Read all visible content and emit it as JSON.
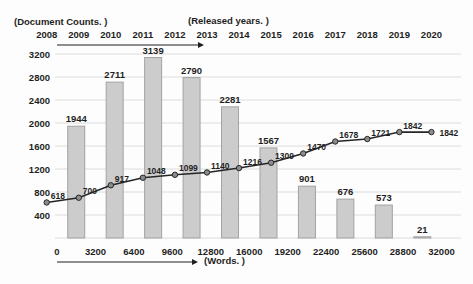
{
  "figure": {
    "y_axis_caption": "(Document Counts. )",
    "top_axis_caption": "(Released years. )",
    "x_axis_caption": "(Words. )"
  },
  "chart_data": {
    "type": "bar",
    "title": "",
    "grid": "horizontal",
    "legend": "none",
    "y_axis": {
      "caption": "(Document Counts. )",
      "ticks": [
        400,
        800,
        1200,
        1600,
        2000,
        2400,
        2800,
        3200
      ],
      "range": [
        0,
        3400
      ]
    },
    "x_bottom_axis": {
      "caption": "(Words. )",
      "ticks": [
        0,
        3200,
        6400,
        9600,
        12800,
        16000,
        19200,
        22400,
        25600,
        28800,
        32000
      ]
    },
    "x_top_axis": {
      "caption": "(Released years. )",
      "ticks": [
        2008,
        2009,
        2010,
        2011,
        2012,
        2013,
        2014,
        2015,
        2016,
        2017,
        2018,
        2019,
        2020
      ]
    },
    "series": [
      {
        "name": "document-counts-per-word-bin",
        "type": "bar",
        "bin_starts": [
          0,
          3200,
          6400,
          9600,
          12800,
          16000,
          19200,
          22400,
          25600,
          28800
        ],
        "bin_width": 3200,
        "values": [
          1944,
          2711,
          3139,
          2790,
          2281,
          1567,
          901,
          676,
          573,
          21
        ]
      },
      {
        "name": "documents-per-released-year",
        "type": "line",
        "categories": [
          2008,
          2009,
          2010,
          2011,
          2012,
          2013,
          2014,
          2015,
          2016,
          2017,
          2018,
          2019,
          2020
        ],
        "values": [
          618,
          700,
          917,
          1048,
          1099,
          1140,
          1216,
          1309,
          1470,
          1678,
          1721,
          1842,
          1842
        ]
      }
    ],
    "colors": {
      "bar_fill": "#cccccc",
      "bar_border": "#a3a3a3",
      "line": "#262626",
      "marker_fill": "#8c8c8c",
      "marker_border": "#262626",
      "grid": "#dcdcdc",
      "text": "#1f1f1f"
    }
  }
}
